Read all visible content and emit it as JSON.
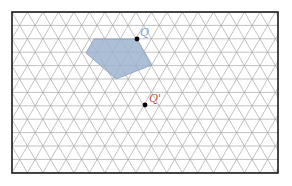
{
  "diagram": {
    "type": "isometric-grid",
    "frame": {
      "x": 12,
      "y": 12,
      "width": 266,
      "height": 161
    },
    "grid": {
      "row_height": 13.4,
      "base": 15.5,
      "rows": 12,
      "line_color": "#a8a8a8",
      "frame_color": "#1a1a1a"
    },
    "shape": {
      "name": "pentagon",
      "fill": "#9fb4cf",
      "stroke": "#8aa0bc",
      "points": [
        [
          94,
          39
        ],
        [
          137,
          39
        ],
        [
          152,
          65
        ],
        [
          116,
          79
        ],
        [
          86,
          53
        ]
      ]
    },
    "points": [
      {
        "id": "Q",
        "label": "Q",
        "x": 137,
        "y": 39,
        "label_x": 140,
        "label_y": 36,
        "label_color": "#7b9cc8"
      },
      {
        "id": "Q-prime",
        "label": "Q'",
        "x": 145,
        "y": 105,
        "label_x": 149,
        "label_y": 102,
        "label_color": "#c0504d"
      }
    ]
  }
}
